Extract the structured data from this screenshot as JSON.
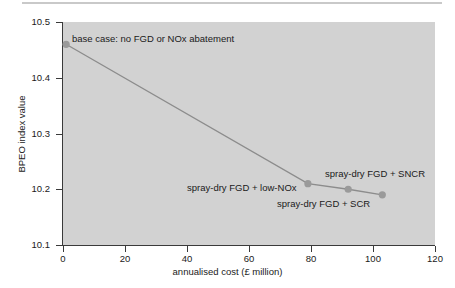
{
  "chart_data": {
    "type": "line",
    "title": "",
    "xlabel": "annualised cost (£ million)",
    "ylabel": "BPEO index value",
    "xlim": [
      0,
      120
    ],
    "ylim": [
      10.1,
      10.5
    ],
    "xticks": [
      "0",
      "20",
      "40",
      "60",
      "80",
      "100",
      "120"
    ],
    "xtick_values": [
      0,
      20,
      40,
      60,
      80,
      100,
      120
    ],
    "yticks": [
      "10.1",
      "10.2",
      "10.3",
      "10.4",
      "10.5"
    ],
    "ytick_values": [
      10.1,
      10.2,
      10.3,
      10.4,
      10.5
    ],
    "grid": false,
    "legend": "none",
    "plot_background": "#d2d2d2",
    "line_color": "#8c8c8c",
    "marker_color": "#9a9a9a",
    "points": [
      {
        "x": 1,
        "y": 10.46,
        "label": "base case: no FGD or NOx abatement"
      },
      {
        "x": 79,
        "y": 10.21,
        "label": "spray-dry FGD + low-NOx"
      },
      {
        "x": 92,
        "y": 10.2,
        "label": "spray-dry FGD + SCR"
      },
      {
        "x": 103,
        "y": 10.19,
        "label": "spray-dry FGD + SNCR"
      }
    ],
    "annotations": [
      {
        "text": "base case: no FGD or NOx abatement",
        "x": 1,
        "y": 10.46
      },
      {
        "text": "spray-dry FGD + low-NOx",
        "x": 79,
        "y": 10.21
      },
      {
        "text": "spray-dry FGD + SNCR",
        "x": 103,
        "y": 10.19
      },
      {
        "text": "spray-dry FGD + SCR",
        "x": 92,
        "y": 10.2
      }
    ]
  }
}
